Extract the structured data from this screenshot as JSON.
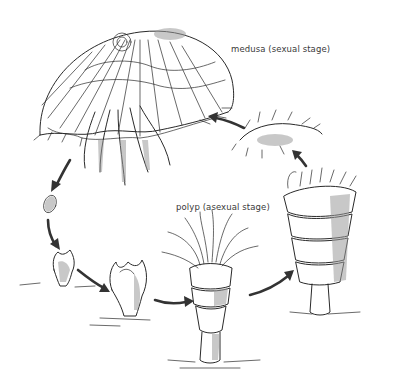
{
  "figure": {
    "labels": {
      "medusa": "medusa (sexual stage)",
      "polyp": "polyp (asexual stage)"
    },
    "stages": [
      {
        "id": "medusa",
        "icon": "medusa-illustration"
      },
      {
        "id": "planula",
        "icon": "planula-larva-illustration"
      },
      {
        "id": "settled-larva",
        "icon": "settled-larva-illustration"
      },
      {
        "id": "young-polyp",
        "icon": "young-polyp-illustration"
      },
      {
        "id": "polyp",
        "icon": "polyp-illustration"
      },
      {
        "id": "strobila",
        "icon": "strobila-illustration"
      },
      {
        "id": "ephyra",
        "icon": "ephyra-illustration"
      }
    ],
    "colors": {
      "background": "#ffffff",
      "ink": "#2a2a2a",
      "arrow": "#333333",
      "label": "#3a3a3a"
    }
  }
}
